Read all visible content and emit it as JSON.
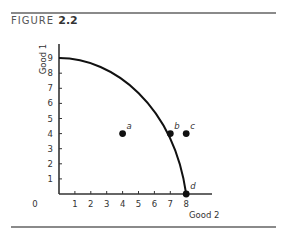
{
  "figure": {
    "label": "FIGURE",
    "number": "2.2"
  },
  "chart_data": {
    "type": "line",
    "title": "FIGURE 2.2",
    "xlabel": "Good 2",
    "ylabel": "Good 1",
    "xlim": [
      0,
      9
    ],
    "ylim": [
      0,
      9.5
    ],
    "x_ticks": [
      1,
      2,
      3,
      4,
      5,
      6,
      7,
      8
    ],
    "y_ticks": [
      1,
      2,
      3,
      4,
      5,
      6,
      7,
      8,
      9
    ],
    "origin_label": "0",
    "grid": false,
    "series": [
      {
        "name": "Production possibility frontier",
        "type": "line",
        "x": [
          0,
          1,
          2,
          3,
          4,
          5,
          6,
          7,
          7.5,
          8
        ],
        "y": [
          9,
          8.9,
          8.6,
          8.0,
          7.2,
          6.2,
          5.0,
          4.0,
          2.4,
          0
        ]
      }
    ],
    "points": [
      {
        "label": "a",
        "x": 4,
        "y": 4
      },
      {
        "label": "b",
        "x": 7,
        "y": 4
      },
      {
        "label": "c",
        "x": 8,
        "y": 4
      },
      {
        "label": "d",
        "x": 8,
        "y": 0
      }
    ]
  }
}
